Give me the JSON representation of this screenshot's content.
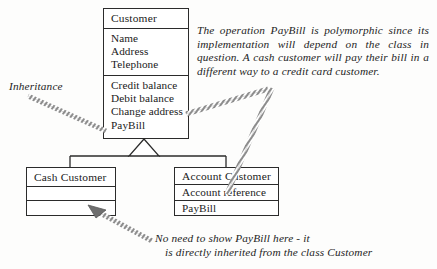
{
  "diagram": {
    "type": "uml-class-diagram",
    "ink_color": "#2b2b2b",
    "background_color": "#fdfdfc"
  },
  "classes": {
    "customer": {
      "name": "Customer",
      "attributes": [
        "Name",
        "Address",
        "Telephone"
      ],
      "operations": [
        "Credit balance",
        "Debit balance",
        "Change address",
        "PayBill"
      ]
    },
    "cash_customer": {
      "name": "Cash Customer",
      "attributes": [],
      "operations": []
    },
    "account_customer": {
      "name": "Account Customer",
      "attributes": [
        "Account reference"
      ],
      "operations": [
        "PayBill"
      ]
    }
  },
  "labels": {
    "inheritance": "Inheritance"
  },
  "annotations": {
    "polymorphic": "The operation PayBill is polymorphic since its implementation will depend on the class in question. A cash customer will pay their bill in a different way to a credit card customer.",
    "inherited_line1": "No need to show PayBill here - it",
    "inherited_line2": "is directly inherited from the class Customer"
  }
}
